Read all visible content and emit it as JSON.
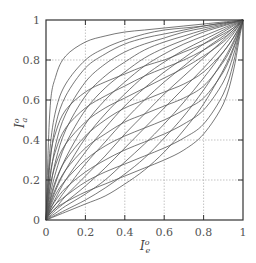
{
  "chart_data": {
    "type": "line",
    "title": "",
    "xlabel": "I_e^o",
    "ylabel": "I_a^o",
    "xlim": [
      0,
      1
    ],
    "ylim": [
      0,
      1
    ],
    "grid": "dotted at 0.2 intervals",
    "legend": null,
    "x_ticks": [
      "0",
      "0.2",
      "0.4",
      "0.6",
      "0.8",
      "1"
    ],
    "y_ticks": [
      "0",
      "0.2",
      "0.4",
      "0.6",
      "0.8",
      "1"
    ],
    "x": [
      0,
      0.02,
      0.05,
      0.1,
      0.2,
      0.3,
      0.4,
      0.5,
      0.6,
      0.7,
      0.8,
      0.9,
      0.95,
      0.98,
      1
    ],
    "series": [
      {
        "name": "c1",
        "values": [
          0,
          0.55,
          0.72,
          0.82,
          0.89,
          0.92,
          0.94,
          0.95,
          0.96,
          0.97,
          0.98,
          0.99,
          0.995,
          0.998,
          1
        ]
      },
      {
        "name": "c2",
        "values": [
          0,
          0.35,
          0.55,
          0.68,
          0.8,
          0.86,
          0.9,
          0.93,
          0.95,
          0.96,
          0.97,
          0.985,
          0.99,
          0.996,
          1
        ]
      },
      {
        "name": "c3",
        "values": [
          0,
          0.28,
          0.48,
          0.62,
          0.76,
          0.83,
          0.88,
          0.91,
          0.93,
          0.95,
          0.97,
          0.985,
          0.99,
          0.996,
          1
        ]
      },
      {
        "name": "c4",
        "values": [
          0,
          0.2,
          0.38,
          0.53,
          0.69,
          0.78,
          0.84,
          0.88,
          0.91,
          0.94,
          0.96,
          0.98,
          0.99,
          0.995,
          1
        ]
      },
      {
        "name": "c5",
        "values": [
          0,
          0.15,
          0.3,
          0.45,
          0.62,
          0.72,
          0.79,
          0.85,
          0.89,
          0.92,
          0.95,
          0.975,
          0.987,
          0.995,
          1
        ]
      },
      {
        "name": "c6",
        "values": [
          0,
          0.12,
          0.24,
          0.38,
          0.55,
          0.66,
          0.74,
          0.81,
          0.86,
          0.9,
          0.94,
          0.97,
          0.985,
          0.994,
          1
        ]
      },
      {
        "name": "c7",
        "values": [
          0,
          0.09,
          0.19,
          0.31,
          0.48,
          0.6,
          0.69,
          0.77,
          0.83,
          0.88,
          0.92,
          0.96,
          0.98,
          0.992,
          1
        ]
      },
      {
        "name": "c8",
        "values": [
          0,
          0.07,
          0.15,
          0.25,
          0.41,
          0.53,
          0.63,
          0.72,
          0.79,
          0.85,
          0.9,
          0.95,
          0.975,
          0.99,
          1
        ]
      },
      {
        "name": "c9",
        "values": [
          0,
          0.05,
          0.11,
          0.2,
          0.34,
          0.46,
          0.57,
          0.66,
          0.74,
          0.81,
          0.88,
          0.94,
          0.97,
          0.988,
          1
        ]
      },
      {
        "name": "c10",
        "values": [
          0,
          0.04,
          0.08,
          0.15,
          0.28,
          0.39,
          0.5,
          0.6,
          0.69,
          0.77,
          0.85,
          0.92,
          0.96,
          0.985,
          1
        ]
      },
      {
        "name": "c11",
        "values": [
          0,
          0.03,
          0.06,
          0.12,
          0.22,
          0.32,
          0.43,
          0.53,
          0.63,
          0.72,
          0.81,
          0.9,
          0.95,
          0.98,
          1
        ]
      },
      {
        "name": "c12",
        "values": [
          0,
          0.02,
          0.05,
          0.09,
          0.17,
          0.26,
          0.36,
          0.46,
          0.56,
          0.66,
          0.76,
          0.87,
          0.93,
          0.975,
          1
        ]
      },
      {
        "name": "c13",
        "values": [
          0,
          0.015,
          0.035,
          0.07,
          0.13,
          0.2,
          0.29,
          0.38,
          0.48,
          0.59,
          0.71,
          0.84,
          0.91,
          0.965,
          1
        ]
      },
      {
        "name": "c14",
        "values": [
          0,
          0.01,
          0.025,
          0.05,
          0.1,
          0.16,
          0.23,
          0.31,
          0.41,
          0.52,
          0.65,
          0.8,
          0.89,
          0.955,
          1
        ]
      },
      {
        "name": "c15",
        "values": [
          0,
          0.008,
          0.02,
          0.04,
          0.08,
          0.12,
          0.18,
          0.25,
          0.34,
          0.45,
          0.58,
          0.75,
          0.86,
          0.94,
          1
        ]
      },
      {
        "name": "s1",
        "values": [
          0,
          0.1,
          0.2,
          0.3,
          0.42,
          0.5,
          0.56,
          0.6,
          0.64,
          0.68,
          0.74,
          0.84,
          0.91,
          0.96,
          1
        ]
      },
      {
        "name": "s2",
        "values": [
          0,
          0.08,
          0.16,
          0.25,
          0.36,
          0.43,
          0.49,
          0.53,
          0.57,
          0.61,
          0.67,
          0.79,
          0.88,
          0.95,
          1
        ]
      },
      {
        "name": "s3",
        "values": [
          0,
          0.06,
          0.13,
          0.2,
          0.3,
          0.37,
          0.42,
          0.46,
          0.5,
          0.55,
          0.61,
          0.74,
          0.85,
          0.94,
          1
        ]
      },
      {
        "name": "s4",
        "values": [
          0,
          0.05,
          0.1,
          0.16,
          0.24,
          0.3,
          0.35,
          0.39,
          0.43,
          0.48,
          0.55,
          0.69,
          0.82,
          0.93,
          1
        ]
      },
      {
        "name": "s5",
        "values": [
          0,
          0.04,
          0.08,
          0.12,
          0.19,
          0.24,
          0.28,
          0.32,
          0.36,
          0.41,
          0.48,
          0.63,
          0.78,
          0.92,
          1
        ]
      },
      {
        "name": "s6",
        "values": [
          0,
          0.03,
          0.06,
          0.09,
          0.14,
          0.18,
          0.22,
          0.26,
          0.3,
          0.35,
          0.43,
          0.58,
          0.74,
          0.9,
          1
        ]
      },
      {
        "name": "r1",
        "values": [
          0,
          0.3,
          0.44,
          0.55,
          0.64,
          0.69,
          0.73,
          0.77,
          0.8,
          0.84,
          0.88,
          0.93,
          0.96,
          0.985,
          1
        ]
      },
      {
        "name": "r2",
        "values": [
          0,
          0.22,
          0.35,
          0.46,
          0.56,
          0.62,
          0.67,
          0.72,
          0.76,
          0.8,
          0.85,
          0.91,
          0.95,
          0.98,
          1
        ]
      },
      {
        "name": "r3",
        "values": [
          0,
          0.16,
          0.28,
          0.38,
          0.49,
          0.56,
          0.61,
          0.66,
          0.71,
          0.76,
          0.82,
          0.89,
          0.94,
          0.975,
          1
        ]
      }
    ]
  },
  "axes": {
    "x_label_main": "I",
    "x_label_sup": "o",
    "x_label_sub": "e",
    "y_label_main": "I",
    "y_label_sup": "o",
    "y_label_sub": "a"
  },
  "colors": {
    "curve": "#555555",
    "frame": "#333333",
    "grid": "#aaaaaa",
    "text": "#555555"
  }
}
